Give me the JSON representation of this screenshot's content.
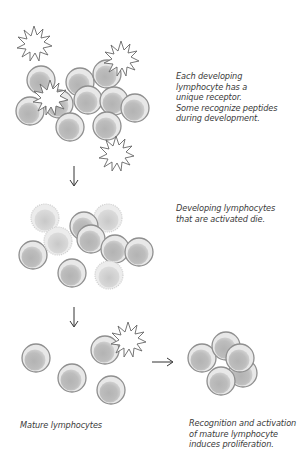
{
  "captions": {
    "stage1": {
      "lines": [
        "Each developing",
        "lymphocyte has a",
        "unique receptor.",
        "Some recognize peptides",
        "during development."
      ]
    },
    "stage2": {
      "lines": [
        "Developing lymphocytes",
        "that are activated die."
      ]
    },
    "stage3_left": {
      "lines": [
        "Mature lymphocytes"
      ]
    },
    "stage3_right": {
      "lines": [
        "Recognition and activation",
        "of mature lymphocyte",
        "induces proliferation."
      ]
    }
  },
  "colors": {
    "cell_fill": "#bdbdbd",
    "cell_rim": "#e6e6e6",
    "cell_outline": "#8a8a8a",
    "dying_fill": "#d6d6d6",
    "dying_outline": "#d0d0d0",
    "antigen_fill": "#ffffff",
    "antigen_outline": "#6a6a6a",
    "arrow": "#333333"
  },
  "arrows": [
    {
      "id": "down-1",
      "direction": "down"
    },
    {
      "id": "down-2",
      "direction": "down"
    },
    {
      "id": "right-1",
      "direction": "right"
    }
  ]
}
